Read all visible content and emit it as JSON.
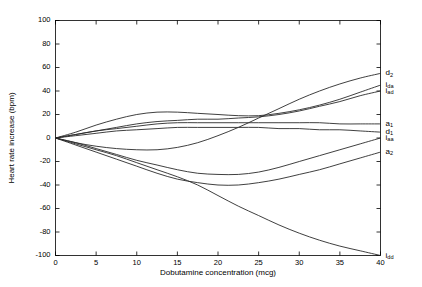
{
  "chart_data": {
    "type": "line",
    "title": "",
    "xlabel": "Dobutamine concentration (mcg)",
    "ylabel": "Heart rate increase (bpm)",
    "xlim": [
      0,
      40
    ],
    "ylim": [
      -100,
      100
    ],
    "xticks": [
      0,
      5,
      10,
      15,
      20,
      25,
      30,
      35,
      40
    ],
    "yticks": [
      -100,
      -80,
      -60,
      -40,
      -20,
      0,
      20,
      40,
      60,
      80,
      100
    ],
    "grid": false,
    "legend": "right-edge-inline-labels",
    "x": [
      0,
      2.5,
      5,
      7.5,
      10,
      12.5,
      15,
      17.5,
      20,
      22.5,
      25,
      27.5,
      30,
      32.5,
      35,
      37.5,
      40
    ],
    "series": [
      {
        "name": "d_2",
        "label_main": "d",
        "label_sub": "2",
        "end_value": 55,
        "values": [
          0,
          -4,
          -7,
          -9,
          -10,
          -10,
          -8,
          -4,
          2,
          9,
          17,
          25,
          33,
          40,
          46,
          51,
          55
        ]
      },
      {
        "name": "i_da",
        "label_main": "i",
        "label_sub": "da",
        "end_value": 45,
        "values": [
          0,
          5,
          11,
          16,
          20,
          22,
          22,
          21,
          20,
          19,
          19,
          21,
          24,
          28,
          33,
          39,
          45
        ]
      },
      {
        "name": "i_ad",
        "label_main": "i",
        "label_sub": "ad",
        "end_value": 40,
        "values": [
          0,
          3,
          6,
          9,
          12,
          14,
          15,
          16,
          16,
          17,
          18,
          20,
          23,
          27,
          31,
          36,
          40
        ]
      },
      {
        "name": "a_1",
        "label_main": "a",
        "label_sub": "1",
        "end_value": 12,
        "values": [
          0,
          3,
          6,
          8,
          10,
          12,
          13,
          13,
          13,
          13,
          13,
          13,
          13,
          13,
          12,
          12,
          12
        ]
      },
      {
        "name": "d_1",
        "label_main": "d",
        "label_sub": "1",
        "end_value": 5,
        "values": [
          0,
          2,
          4,
          6,
          7,
          8,
          9,
          9,
          9,
          9,
          9,
          8,
          8,
          7,
          7,
          6,
          5
        ]
      },
      {
        "name": "i_aa",
        "label_main": "i",
        "label_sub": "aa",
        "end_value": 0,
        "values": [
          0,
          -4,
          -9,
          -14,
          -19,
          -23,
          -27,
          -30,
          -31,
          -31,
          -29,
          -25,
          -20,
          -15,
          -10,
          -5,
          0
        ]
      },
      {
        "name": "a_2",
        "label_main": "a",
        "label_sub": "2",
        "end_value": -12,
        "values": [
          0,
          -6,
          -12,
          -18,
          -24,
          -30,
          -35,
          -38,
          -40,
          -40,
          -38,
          -35,
          -31,
          -27,
          -22,
          -17,
          -12
        ]
      },
      {
        "name": "i_dd",
        "label_main": "i",
        "label_sub": "dd",
        "end_value": -100,
        "values": [
          0,
          -5,
          -10,
          -15,
          -21,
          -27,
          -33,
          -40,
          -49,
          -58,
          -66,
          -74,
          -81,
          -87,
          -92,
          -96,
          -100
        ]
      }
    ]
  },
  "axes": {
    "xlabel": "Dobutamine concentration (mcg)",
    "ylabel": "Heart rate increase (bpm)"
  }
}
